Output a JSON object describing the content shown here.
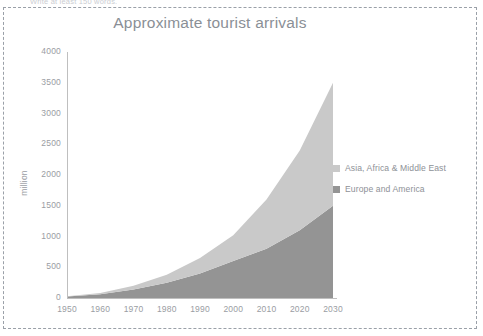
{
  "page": {
    "instruction_note": "Write at least 150 words."
  },
  "chart_data": {
    "type": "area",
    "stacked": true,
    "title": "Approximate tourist arrivals",
    "xlabel": "",
    "ylabel": "million",
    "x": [
      1950,
      1960,
      1970,
      1980,
      1990,
      2000,
      2010,
      2020,
      2030
    ],
    "xtick_labels": [
      "1950",
      "1960",
      "1970",
      "1980",
      "1990",
      "2000",
      "2010",
      "2020",
      "2030"
    ],
    "ytick_labels": [
      "0",
      "500",
      "1000",
      "1500",
      "2000",
      "2500",
      "3000",
      "3500",
      "4000"
    ],
    "ytick_values": [
      0,
      500,
      1000,
      1500,
      2000,
      2500,
      3000,
      3500,
      4000
    ],
    "xlim": [
      1950,
      2030
    ],
    "ylim": [
      0,
      4000
    ],
    "grid": false,
    "legend_position": "right",
    "series": [
      {
        "name": "Europe and America",
        "color": "#949494",
        "values": [
          25,
          60,
          140,
          250,
          400,
          600,
          800,
          1100,
          1500
        ]
      },
      {
        "name": "Asia, Africa & Middle East",
        "color": "#c9c9c9",
        "values": [
          5,
          20,
          60,
          130,
          250,
          420,
          800,
          1300,
          2000
        ]
      }
    ],
    "totals": [
      30,
      80,
      200,
      380,
      650,
      1020,
      1600,
      2400,
      3500
    ]
  },
  "legend": {
    "items": [
      {
        "label": "Asia, Africa & Middle East",
        "color": "#c9c9c9"
      },
      {
        "label": "Europe and America",
        "color": "#949494"
      }
    ]
  },
  "colors": {
    "axis_text": "#9a9da3",
    "title_text": "#8a8f96",
    "axis_line": "#bfbfbf",
    "frame_border": "#9aa0a8"
  }
}
